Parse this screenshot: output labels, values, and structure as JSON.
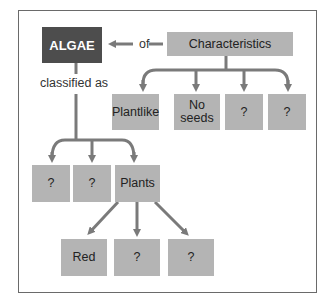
{
  "diagram": {
    "type": "concept-map",
    "root": "ALGAE",
    "linking_words": {
      "of": "of",
      "classified_as": "classified as"
    },
    "characteristics": {
      "label": "Characteristics",
      "children": [
        "Plantlike",
        "No\nseeds",
        "?",
        "?"
      ]
    },
    "classification": {
      "children": [
        "?",
        "?",
        "Plants"
      ],
      "plants_children": [
        "Red",
        "?",
        "?"
      ]
    },
    "colors": {
      "root_box": "#4d4d4d",
      "box": "#b4b4b4",
      "arrow": "#7a7a7a",
      "frame": "#6a6a6a"
    }
  }
}
